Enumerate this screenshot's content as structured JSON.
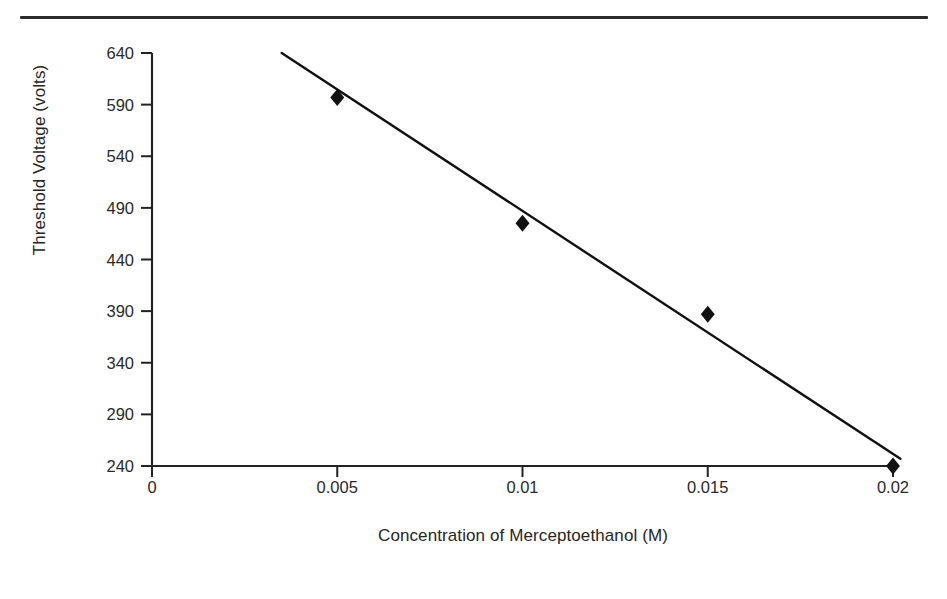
{
  "figure": {
    "top_rule": "horizontal-rule",
    "background_color": "#ffffff",
    "ink_color": "#1a1a1a"
  },
  "chart_data": {
    "type": "scatter",
    "title": "",
    "xlabel": "Concentration of Merceptoethanol (M)",
    "ylabel": "Threshold Voltage (volts)",
    "x": [
      0.005,
      0.01,
      0.015,
      0.02
    ],
    "values": [
      597,
      475,
      387,
      240
    ],
    "series": [
      {
        "name": "Threshold Voltage",
        "marker": "filled-diamond",
        "marker_color": "#111111",
        "x": [
          0.005,
          0.01,
          0.015,
          0.02
        ],
        "values": [
          597,
          475,
          387,
          240
        ]
      }
    ],
    "trendline": {
      "type": "linear",
      "color": "#111111",
      "x_start": 0.0035,
      "y_start": 640,
      "x_end": 0.0202,
      "y_end": 247
    },
    "xlim": [
      0,
      0.02
    ],
    "ylim": [
      240,
      640
    ],
    "xticks": [
      0,
      0.005,
      0.01,
      0.015,
      0.02
    ],
    "xtick_labels": [
      "0",
      "0.005",
      "0.01",
      "0.015",
      "0.02"
    ],
    "yticks": [
      240,
      290,
      340,
      390,
      440,
      490,
      540,
      590,
      640
    ],
    "ytick_labels": [
      "240",
      "290",
      "340",
      "390",
      "440",
      "490",
      "540",
      "590",
      "640"
    ],
    "grid": false,
    "legend": false,
    "legend_position": "none"
  }
}
